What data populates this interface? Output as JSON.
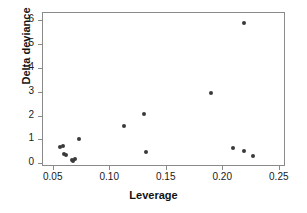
{
  "chart_data": {
    "type": "scatter",
    "title": "",
    "xlabel": "Leverage",
    "ylabel": "Delta deviance",
    "xlim": [
      0.0405,
      0.2555
    ],
    "ylim": [
      -0.12,
      6.35
    ],
    "grid": false,
    "legend": "none",
    "xticks": [
      0.05,
      0.1,
      0.15,
      0.2,
      0.25
    ],
    "xticklabels": [
      "0.05",
      "0.10",
      "0.15",
      "0.20",
      "0.25"
    ],
    "yticks": [
      0,
      1,
      2,
      3,
      4,
      5,
      6
    ],
    "yticklabels": [
      "0",
      "1",
      "2",
      "3",
      "4",
      "5",
      "6"
    ],
    "marker": "filled-circle",
    "marker_color": "#3a3a3a",
    "points": [
      {
        "x": 0.0555,
        "y": 0.7
      },
      {
        "x": 0.0585,
        "y": 0.78
      },
      {
        "x": 0.059,
        "y": 0.44
      },
      {
        "x": 0.0605,
        "y": 0.4
      },
      {
        "x": 0.066,
        "y": 0.16
      },
      {
        "x": 0.0672,
        "y": 0.12
      },
      {
        "x": 0.0685,
        "y": 0.2
      },
      {
        "x": 0.072,
        "y": 1.05
      },
      {
        "x": 0.1125,
        "y": 1.6
      },
      {
        "x": 0.1295,
        "y": 2.1
      },
      {
        "x": 0.132,
        "y": 0.5
      },
      {
        "x": 0.189,
        "y": 3.0
      },
      {
        "x": 0.209,
        "y": 0.66
      },
      {
        "x": 0.218,
        "y": 5.95
      },
      {
        "x": 0.2185,
        "y": 0.57
      },
      {
        "x": 0.2265,
        "y": 0.36
      }
    ]
  },
  "axes": {
    "frame_color": "#8a8a8a"
  }
}
